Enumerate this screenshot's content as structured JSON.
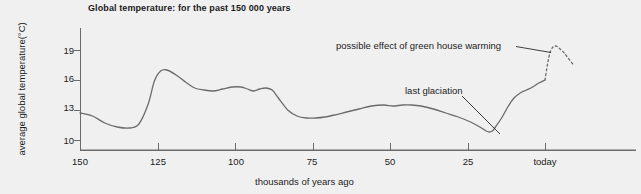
{
  "chart_data": {
    "type": "line",
    "title": "Global temperature: for the past 150 000 years",
    "xlabel": "thousands of years ago",
    "ylabel": "average global temperature(°C)",
    "xlim": [
      150,
      -10
    ],
    "ylim": [
      9,
      20.3
    ],
    "grid": false,
    "legend": false,
    "x_tick_labels": [
      "150",
      "125",
      "100",
      "75",
      "50",
      "25",
      "today"
    ],
    "x_tick_values": [
      150,
      125,
      100,
      75,
      50,
      25,
      0
    ],
    "y_tick_labels": [
      "19",
      "16",
      "13",
      "10"
    ],
    "y_tick_values": [
      19,
      16,
      13,
      10
    ],
    "x_axis_direction": "reversed",
    "series": [
      {
        "name": "reconstructed average global temperature",
        "style": "solid",
        "color": "#6b6b6b",
        "x": [
          150,
          146,
          142,
          138,
          134,
          131,
          128,
          126,
          124,
          122,
          119,
          116,
          113,
          110,
          107,
          104,
          101,
          98,
          96,
          94,
          92,
          90,
          88,
          86,
          83,
          80,
          77,
          74,
          71,
          68,
          64,
          60,
          56,
          52,
          49,
          46,
          43,
          40,
          36,
          32,
          28,
          24,
          21,
          19,
          18,
          17,
          16,
          14,
          12,
          10,
          8,
          6,
          4,
          2,
          0
        ],
        "y": [
          12.7,
          12.4,
          11.7,
          11.3,
          11.2,
          11.6,
          13.6,
          15.9,
          16.9,
          17.0,
          16.5,
          15.8,
          15.2,
          15.0,
          14.9,
          15.1,
          15.3,
          15.3,
          15.1,
          14.9,
          15.1,
          15.2,
          15.0,
          14.2,
          13.0,
          12.4,
          12.2,
          12.2,
          12.3,
          12.5,
          12.8,
          13.1,
          13.4,
          13.5,
          13.4,
          13.5,
          13.5,
          13.4,
          13.1,
          12.7,
          12.3,
          11.8,
          11.3,
          10.9,
          10.8,
          10.9,
          11.3,
          12.2,
          13.3,
          14.2,
          14.7,
          15.0,
          15.3,
          15.7,
          16.0
        ]
      },
      {
        "name": "possible effect of green house warming",
        "style": "dashed",
        "color": "#6b6b6b",
        "x": [
          0,
          -0.6,
          -1.2,
          -1.8,
          -2.6,
          -3.4,
          -4.2,
          -5.2,
          -6.2,
          -7.2,
          -8.2,
          -9.0
        ],
        "y": [
          16.0,
          17.2,
          18.2,
          18.9,
          19.3,
          19.4,
          19.3,
          19.0,
          18.7,
          18.3,
          17.9,
          17.6
        ]
      }
    ],
    "annotations": [
      {
        "name": "possible-effect-of-green-house-warming",
        "text": "possible effect of green house warming",
        "points_to": {
          "x": -2.2,
          "y": 19.2
        }
      },
      {
        "name": "last-glaciation",
        "text": "last glaciation",
        "points_to": {
          "x": 18,
          "y": 10.8
        }
      }
    ]
  }
}
